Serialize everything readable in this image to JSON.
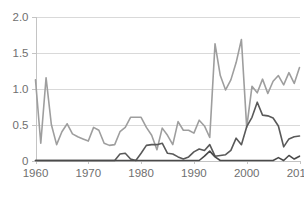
{
  "chart_data": {
    "type": "line",
    "title": "",
    "xlabel": "",
    "ylabel": "",
    "xlim": [
      1960,
      2010
    ],
    "ylim": [
      0,
      2.0
    ],
    "grid": true,
    "legend": "none",
    "x_ticks": [
      "1960",
      "1970",
      "1980",
      "1990",
      "2000",
      "2010"
    ],
    "x_tick_values": [
      1960,
      1970,
      1980,
      1990,
      2000,
      2010
    ],
    "y_ticks": [
      "0",
      "0.5",
      "1.0",
      "1.5",
      "2.0"
    ],
    "y_tick_values": [
      0,
      0.5,
      1.0,
      1.5,
      2.0
    ],
    "x": [
      1960,
      1961,
      1962,
      1963,
      1964,
      1965,
      1966,
      1967,
      1968,
      1969,
      1970,
      1971,
      1972,
      1973,
      1974,
      1975,
      1976,
      1977,
      1978,
      1979,
      1980,
      1981,
      1982,
      1983,
      1984,
      1985,
      1986,
      1987,
      1988,
      1989,
      1990,
      1991,
      1992,
      1993,
      1994,
      1995,
      1996,
      1997,
      1998,
      1999,
      2000,
      2001,
      2002,
      2003,
      2004,
      2005,
      2006,
      2007,
      2008,
      2009,
      2010
    ],
    "series": [
      {
        "name": "series-light",
        "color": "#9e9e9e",
        "width": 1.6,
        "values": [
          1.12,
          0.24,
          1.15,
          0.5,
          0.22,
          0.4,
          0.51,
          0.37,
          0.33,
          0.3,
          0.27,
          0.46,
          0.42,
          0.24,
          0.21,
          0.22,
          0.4,
          0.46,
          0.6,
          0.6,
          0.6,
          0.46,
          0.35,
          0.15,
          0.45,
          0.35,
          0.22,
          0.54,
          0.42,
          0.42,
          0.38,
          0.56,
          0.48,
          0.32,
          1.62,
          1.18,
          0.98,
          1.12,
          1.36,
          1.68,
          0.46,
          1.03,
          0.94,
          1.13,
          0.93,
          1.1,
          1.18,
          1.05,
          1.22,
          1.07,
          1.29
        ]
      },
      {
        "name": "series-medium",
        "color": "#595959",
        "width": 1.6,
        "values": [
          0.0,
          0.0,
          0.0,
          0.0,
          0.0,
          0.0,
          0.0,
          0.0,
          0.0,
          0.0,
          0.0,
          0.0,
          0.0,
          0.0,
          0.0,
          0.0,
          0.09,
          0.1,
          0.02,
          0.0,
          0.1,
          0.21,
          0.22,
          0.22,
          0.24,
          0.1,
          0.09,
          0.05,
          0.02,
          0.05,
          0.12,
          0.16,
          0.14,
          0.22,
          0.06,
          0.07,
          0.08,
          0.14,
          0.31,
          0.22,
          0.47,
          0.6,
          0.81,
          0.63,
          0.62,
          0.59,
          0.48,
          0.19,
          0.3,
          0.33,
          0.34
        ]
      },
      {
        "name": "series-dark",
        "color": "#4a4a4a",
        "width": 1.6,
        "values": [
          0.0,
          0.0,
          0.0,
          0.0,
          0.0,
          0.0,
          0.0,
          0.0,
          0.0,
          0.0,
          0.0,
          0.0,
          0.0,
          0.0,
          0.0,
          0.0,
          0.0,
          0.0,
          0.0,
          0.0,
          0.0,
          0.0,
          0.0,
          0.0,
          0.0,
          0.0,
          0.0,
          0.0,
          0.0,
          0.0,
          0.0,
          0.0,
          0.06,
          0.13,
          0.05,
          0.0,
          0.0,
          0.0,
          0.0,
          0.0,
          0.0,
          0.0,
          0.0,
          0.0,
          0.0,
          0.0,
          0.04,
          0.0,
          0.07,
          0.02,
          0.06
        ]
      }
    ]
  }
}
